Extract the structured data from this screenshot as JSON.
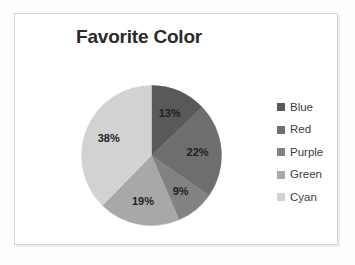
{
  "frame": {
    "border_color": "#d3d3d3",
    "background": "#ffffff"
  },
  "chart_data": {
    "type": "pie",
    "title": "Favorite Color",
    "xlabel": "",
    "ylabel": "",
    "legend_position": "right",
    "grid": false,
    "categories": [
      "Blue",
      "Red",
      "Purple",
      "Green",
      "Cyan"
    ],
    "values": [
      13,
      22,
      9,
      19,
      38
    ],
    "value_unit": "%",
    "data_labels": [
      "13%",
      "22%",
      "9%",
      "19%",
      "38%"
    ],
    "colors": [
      "#595959",
      "#6e6e6e",
      "#828282",
      "#a8a8a8",
      "#d2d2d2"
    ],
    "start_angle_deg": 0,
    "direction": "clockwise",
    "slices": [
      {
        "label": "Blue",
        "value": 13,
        "data_label": "13%",
        "color": "#595959"
      },
      {
        "label": "Red",
        "value": 22,
        "data_label": "22%",
        "color": "#6e6e6e"
      },
      {
        "label": "Purple",
        "value": 9,
        "data_label": "9%",
        "color": "#828282"
      },
      {
        "label": "Green",
        "value": 19,
        "data_label": "19%",
        "color": "#a8a8a8"
      },
      {
        "label": "Cyan",
        "value": 38,
        "data_label": "38%",
        "color": "#d2d2d2"
      }
    ]
  },
  "legend": {
    "items": [
      {
        "label": "Blue",
        "color": "#595959"
      },
      {
        "label": "Red",
        "color": "#6e6e6e"
      },
      {
        "label": "Purple",
        "color": "#828282"
      },
      {
        "label": "Green",
        "color": "#a8a8a8"
      },
      {
        "label": "Cyan",
        "color": "#d2d2d2"
      }
    ]
  },
  "labels": {
    "slice_0": "13%",
    "slice_1": "22%",
    "slice_2": "9%",
    "slice_3": "19%",
    "slice_4": "38%"
  }
}
